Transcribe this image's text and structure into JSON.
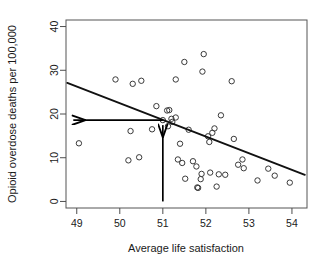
{
  "chart_data": {
    "type": "scatter",
    "title": "",
    "xlabel": "Average life satisfaction",
    "ylabel": "Opioid overdose deaths per 100,000",
    "xlim": [
      48.75,
      54.35
    ],
    "ylim": [
      -1.5,
      41.5
    ],
    "xticks": [
      49,
      50,
      51,
      52,
      53,
      54
    ],
    "yticks": [
      0,
      10,
      20,
      30,
      40
    ],
    "xtick_labels": [
      "49",
      "50",
      "51",
      "52",
      "53",
      "54"
    ],
    "ytick_labels": [
      "0",
      "10",
      "20",
      "30",
      "40"
    ],
    "grid": false,
    "legend": false,
    "marker": "open-circle",
    "points": [
      {
        "x": 49.05,
        "y": 13.3
      },
      {
        "x": 49.9,
        "y": 27.9
      },
      {
        "x": 50.2,
        "y": 9.4
      },
      {
        "x": 50.25,
        "y": 16.1
      },
      {
        "x": 50.3,
        "y": 26.9
      },
      {
        "x": 50.45,
        "y": 10.1
      },
      {
        "x": 50.5,
        "y": 27.6
      },
      {
        "x": 50.75,
        "y": 16.5
      },
      {
        "x": 50.85,
        "y": 21.8
      },
      {
        "x": 51.0,
        "y": 18.6
      },
      {
        "x": 51.1,
        "y": 20.8
      },
      {
        "x": 51.12,
        "y": 17.2
      },
      {
        "x": 51.15,
        "y": 20.9
      },
      {
        "x": 51.2,
        "y": 18.9
      },
      {
        "x": 51.22,
        "y": 18.2
      },
      {
        "x": 51.3,
        "y": 19.2
      },
      {
        "x": 51.3,
        "y": 27.9
      },
      {
        "x": 51.35,
        "y": 9.6
      },
      {
        "x": 51.4,
        "y": 13.2
      },
      {
        "x": 51.45,
        "y": 8.8
      },
      {
        "x": 51.5,
        "y": 31.9
      },
      {
        "x": 51.52,
        "y": 5.2
      },
      {
        "x": 51.6,
        "y": 16.4
      },
      {
        "x": 51.7,
        "y": 9.2
      },
      {
        "x": 51.78,
        "y": 8.0
      },
      {
        "x": 51.8,
        "y": 3.2
      },
      {
        "x": 51.82,
        "y": 3.1
      },
      {
        "x": 51.88,
        "y": 5.1
      },
      {
        "x": 51.9,
        "y": 6.3
      },
      {
        "x": 51.92,
        "y": 29.7
      },
      {
        "x": 51.95,
        "y": 33.7
      },
      {
        "x": 52.05,
        "y": 14.9
      },
      {
        "x": 52.08,
        "y": 13.6
      },
      {
        "x": 52.1,
        "y": 6.6
      },
      {
        "x": 52.15,
        "y": 15.7
      },
      {
        "x": 52.2,
        "y": 16.7
      },
      {
        "x": 52.25,
        "y": 3.4
      },
      {
        "x": 52.3,
        "y": 6.2
      },
      {
        "x": 52.35,
        "y": 19.7
      },
      {
        "x": 52.45,
        "y": 6.1
      },
      {
        "x": 52.6,
        "y": 27.5
      },
      {
        "x": 52.65,
        "y": 14.3
      },
      {
        "x": 52.75,
        "y": 8.4
      },
      {
        "x": 52.85,
        "y": 9.6
      },
      {
        "x": 52.88,
        "y": 7.6
      },
      {
        "x": 53.2,
        "y": 4.8
      },
      {
        "x": 53.45,
        "y": 7.5
      },
      {
        "x": 53.6,
        "y": 5.9
      },
      {
        "x": 53.95,
        "y": 4.3
      }
    ],
    "trend_line": {
      "label": "regression line",
      "x_start": 48.78,
      "y_start": 27.1,
      "x_end": 54.3,
      "y_end": 6.1
    },
    "annotations": [
      {
        "name": "vertical-reference-arrow",
        "description": "vertical arrow from x-axis at x=51 up to predicted value",
        "x": 51.0,
        "y_from": 0,
        "y_to": 18.6
      },
      {
        "name": "horizontal-reference-arrow",
        "description": "horizontal arrow from x=51 leftwards to y-axis at predicted value",
        "y": 18.6,
        "x_from": 51.0,
        "x_to": 48.78
      }
    ]
  },
  "colors": {
    "axis": "#4d4d4d",
    "point_stroke": "#3a3a3a",
    "line": "#111111",
    "annotation": "#000000",
    "text": "#1a1a1a",
    "background": "#ffffff"
  }
}
